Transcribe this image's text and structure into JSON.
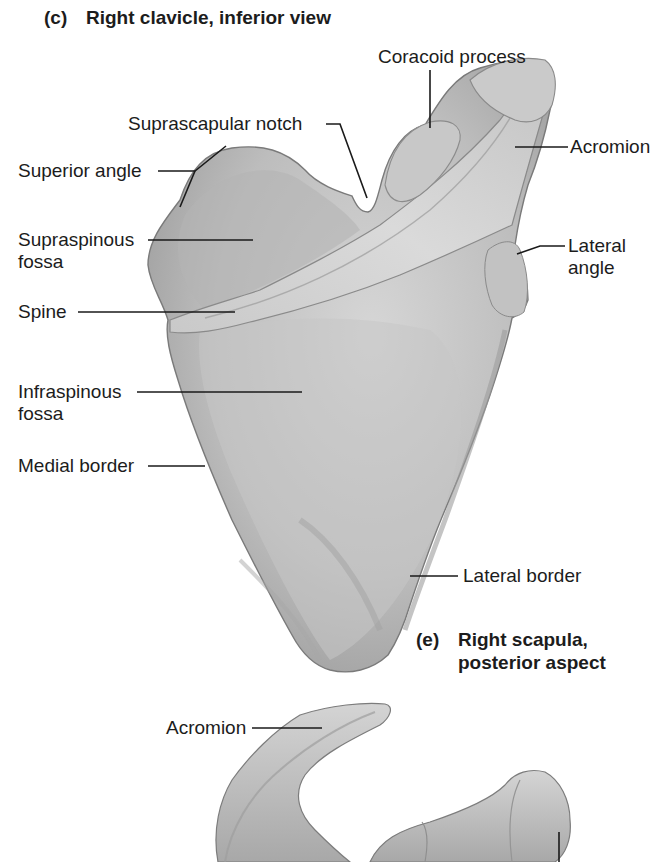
{
  "figure": {
    "top_caption": {
      "tag": "(c)",
      "text": "Right clavicle, inferior view"
    },
    "panel_e_caption": {
      "tag": "(e)",
      "line1": "Right scapula,",
      "line2": "posterior aspect"
    }
  },
  "labels": {
    "coracoid_process": "Coracoid process",
    "suprascapular_notch": "Suprascapular notch",
    "acromion_upper": "Acromion",
    "superior_angle": "Superior angle",
    "supraspinous_fossa_line1": "Supraspinous",
    "supraspinous_fossa_line2": "fossa",
    "lateral_angle_line1": "Lateral",
    "lateral_angle_line2": "angle",
    "spine": "Spine",
    "infraspinous_fossa_line1": "Infraspinous",
    "infraspinous_fossa_line2": "fossa",
    "medial_border": "Medial border",
    "lateral_border": "Lateral border",
    "acromion_lower": "Acromion"
  },
  "colors": {
    "background": "#ffffff",
    "bone_fill": "#b9b9b9",
    "bone_light": "#d2d2d2",
    "bone_shadow": "#8e8e8e",
    "bone_outline": "#6a6a6a",
    "leader_line": "#1a1a1a",
    "text": "#1c1c1c"
  }
}
